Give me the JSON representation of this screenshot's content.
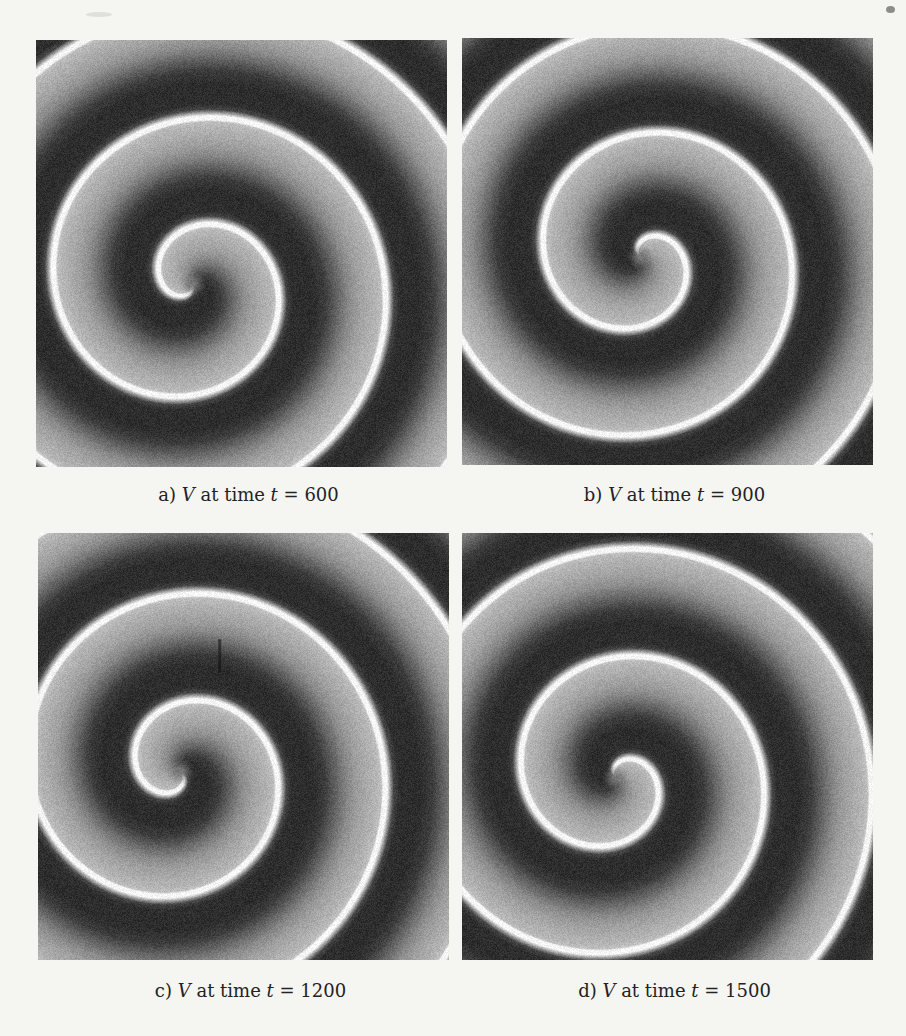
{
  "figure": {
    "kind": "scanned grayscale spiral-wave simulation figure, 2x2 panels",
    "colors": {
      "paper": "#f5f5f2",
      "field_dark": "#2c2c2c",
      "field_mid": "#7a7a7a",
      "field_light": "#b6b6b6",
      "front_line": "#f6f6f6",
      "caption_ink": "#232323"
    },
    "panels": [
      {
        "id": "a",
        "caption": {
          "prefix": "a)",
          "variable": "V",
          "middle": "at time",
          "time_symbol": "t",
          "value": "= 600"
        },
        "spiral": {
          "core_x": 0.38,
          "core_y": 0.57,
          "phase": 0.222,
          "chirality": 1
        }
      },
      {
        "id": "b",
        "caption": {
          "prefix": "b)",
          "variable": "V",
          "middle": "at time",
          "time_symbol": "t",
          "value": "= 900"
        },
        "spiral": {
          "core_x": 0.434,
          "core_y": 0.512,
          "phase": 0.611,
          "chirality": 1
        }
      },
      {
        "id": "c",
        "caption": {
          "prefix": "c)",
          "variable": "V",
          "middle": "at time",
          "time_symbol": "t",
          "value": "= 1200"
        },
        "spiral": {
          "core_x": 0.345,
          "core_y": 0.558,
          "phase": 0.111,
          "chirality": 1,
          "scratch": {
            "x": 0.442,
            "y0": 0.249,
            "y1": 0.326
          }
        }
      },
      {
        "id": "d",
        "caption": {
          "prefix": "d)",
          "variable": "V",
          "middle": "at time",
          "time_symbol": "t",
          "value": "= 1500"
        },
        "spiral": {
          "core_x": 0.373,
          "core_y": 0.572,
          "phase": 0.639,
          "chirality": 1
        }
      }
    ],
    "spiral_field": {
      "wavelength": 108,
      "noise": 13,
      "core_radius": 15,
      "core_value": 120,
      "waveform": [
        [
          0,
          246
        ],
        [
          0.02,
          246
        ],
        [
          0.045,
          170
        ],
        [
          0.08,
          70
        ],
        [
          0.13,
          46
        ],
        [
          0.32,
          44
        ],
        [
          0.44,
          60
        ],
        [
          0.55,
          100
        ],
        [
          0.66,
          138
        ],
        [
          0.75,
          158
        ],
        [
          0.85,
          172
        ],
        [
          0.93,
          182
        ],
        [
          0.965,
          192
        ],
        [
          0.982,
          246
        ],
        [
          1,
          246
        ]
      ]
    }
  }
}
